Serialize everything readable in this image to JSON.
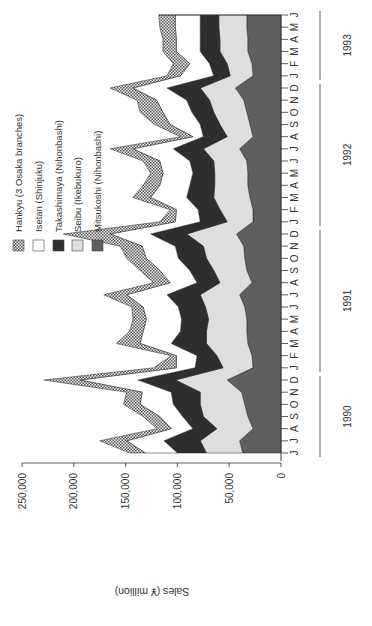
{
  "chart_data": {
    "type": "area",
    "stacked": true,
    "orientation": "rotated-90-ccw",
    "title": "",
    "ylabel": "Sales (¥ million)",
    "xlabel": "",
    "ylim": [
      0,
      250000
    ],
    "y_ticks": [
      "0",
      "50,000",
      "100,000",
      "150,000",
      "200,000",
      "250,000"
    ],
    "y_tick_values": [
      0,
      50000,
      100000,
      150000,
      200000,
      250000
    ],
    "grid": false,
    "legend_position": "upper-left (inside plot)",
    "month_labels": [
      "J",
      "J",
      "A",
      "S",
      "O",
      "N",
      "D",
      "J",
      "F",
      "M",
      "A",
      "M",
      "J",
      "J",
      "A",
      "S",
      "O",
      "N",
      "D",
      "J",
      "F",
      "M",
      "A",
      "M",
      "J",
      "J",
      "A",
      "S",
      "O",
      "N",
      "D",
      "J",
      "F",
      "M",
      "A",
      "M",
      "J"
    ],
    "x": [
      "1990-06",
      "1990-07",
      "1990-08",
      "1990-09",
      "1990-10",
      "1990-11",
      "1990-12",
      "1991-01",
      "1991-02",
      "1991-03",
      "1991-04",
      "1991-05",
      "1991-06",
      "1991-07",
      "1991-08",
      "1991-09",
      "1991-10",
      "1991-11",
      "1991-12",
      "1992-01",
      "1992-02",
      "1992-03",
      "1992-04",
      "1992-05",
      "1992-06",
      "1992-07",
      "1992-08",
      "1992-09",
      "1992-10",
      "1992-11",
      "1992-12",
      "1993-01",
      "1993-02",
      "1993-03",
      "1993-04",
      "1993-05",
      "1993-06"
    ],
    "years": [
      {
        "label": "1990",
        "start": 0,
        "end": 6
      },
      {
        "label": "1991",
        "start": 7,
        "end": 18
      },
      {
        "label": "1992",
        "start": 19,
        "end": 30
      },
      {
        "label": "1993",
        "start": 31,
        "end": 36
      }
    ],
    "series": [
      {
        "name": "Mitsukoshi (Nihonbashi)",
        "fill": "#5f5f5f",
        "pattern": "solid-dark",
        "values": [
          37000,
          40000,
          27000,
          32000,
          35000,
          38000,
          52000,
          27000,
          28000,
          32000,
          33000,
          33000,
          35000,
          40000,
          28000,
          33000,
          35000,
          36000,
          43000,
          27000,
          27000,
          30000,
          32000,
          32000,
          33000,
          40000,
          27000,
          30000,
          33000,
          36000,
          44000,
          27000,
          28000,
          32000,
          32000,
          33000,
          33000
        ]
      },
      {
        "name": "Seibu (Ikebukuro)",
        "fill": "#dedede",
        "pattern": "solid-light",
        "values": [
          35000,
          38000,
          35000,
          43000,
          43000,
          40000,
          50000,
          29000,
          34000,
          40000,
          39000,
          37000,
          38000,
          38000,
          31000,
          32000,
          37000,
          39000,
          48000,
          25000,
          32000,
          35000,
          32000,
          32000,
          32000,
          35000,
          25000,
          29000,
          32000,
          33000,
          34000,
          22000,
          24000,
          27000,
          27000,
          27000,
          27000
        ]
      },
      {
        "name": "Takashimaya (Nihonbashi)",
        "fill": "#2e2e2e",
        "pattern": "solid-black",
        "values": [
          28000,
          35000,
          23000,
          20000,
          26000,
          28000,
          36000,
          27000,
          19000,
          34000,
          25000,
          26000,
          26000,
          32000,
          22000,
          23000,
          27000,
          27000,
          35000,
          26000,
          21000,
          26000,
          24000,
          21000,
          23000,
          29000,
          23000,
          19000,
          21000,
          22000,
          32000,
          16000,
          17000,
          19000,
          19000,
          18000,
          18000
        ]
      },
      {
        "name": "Isetan (Shinjuku)",
        "fill": "#ffffff",
        "pattern": "white",
        "values": [
          31000,
          36000,
          21000,
          22000,
          32000,
          28000,
          56000,
          18000,
          20000,
          30000,
          36000,
          34000,
          34000,
          39000,
          26000,
          29000,
          31000,
          32000,
          39000,
          24000,
          21000,
          35000,
          29000,
          29000,
          29000,
          39000,
          10000,
          29000,
          28000,
          29000,
          33000,
          32000,
          19000,
          23000,
          23000,
          24000,
          24000
        ]
      },
      {
        "name": "Hankyu (3 Osaka branches)",
        "fill": "checker",
        "pattern": "checkerboard",
        "values": [
          15000,
          26000,
          14000,
          16000,
          16000,
          15000,
          35000,
          22000,
          5000,
          23000,
          13000,
          13000,
          11000,
          22000,
          16000,
          19000,
          19000,
          21000,
          45000,
          15000,
          6000,
          17000,
          16000,
          12000,
          16000,
          22000,
          12000,
          15000,
          22000,
          19000,
          22000,
          13000,
          16000,
          13000,
          13000,
          15000,
          16000
        ]
      }
    ]
  },
  "legend": {
    "items": [
      {
        "label": "Hankyu (3 Osaka branches)",
        "swatch": "checker"
      },
      {
        "label": "Isetan (Shinjuku)",
        "swatch": "#ffffff"
      },
      {
        "label": "Takashimaya (Nihonbashi)",
        "swatch": "#2e2e2e"
      },
      {
        "label": "Seibu (Ikebukuro)",
        "swatch": "#dedede"
      },
      {
        "label": "Mitsukoshi (Nihonbashi)",
        "swatch": "#5f5f5f"
      }
    ]
  },
  "axis": {
    "value_title": "Sales (¥ million)"
  }
}
